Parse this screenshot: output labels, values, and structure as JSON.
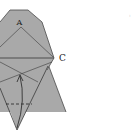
{
  "diagram": {
    "type": "origami-fold-step",
    "labels": {
      "point_a": "A",
      "point_c": "C"
    },
    "colors": {
      "paper": "#a9a9a9",
      "paper_dark_edge": "#555555",
      "crease": "#3a3a3a",
      "background": "#ffffff"
    },
    "elements": {
      "upper_flap": "hexagonal upper section with apex A",
      "lower_flap": "triangular lower section",
      "center_fold_line": "horizontal fold line through C",
      "valley_fold": "dashed line near bottom",
      "fold_arrow": "curved arrow pointing upward from bottom point"
    },
    "clipped_text_right": ":"
  }
}
